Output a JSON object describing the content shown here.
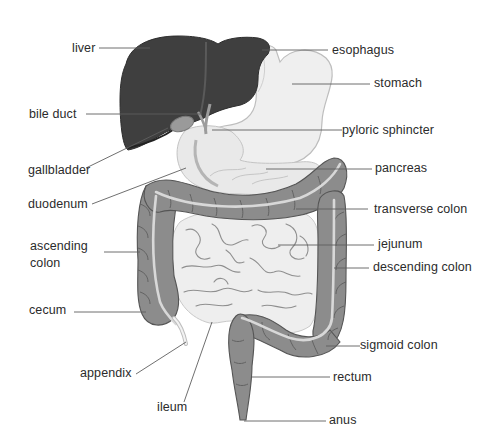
{
  "diagram": {
    "type": "anatomy-labeled-illustration",
    "colors": {
      "liver": "#3d3d3d",
      "stomach": "#ededed",
      "stomach_outline": "#b9b9b9",
      "colon": "#8a8a8a",
      "colon_outline": "#555555",
      "colon_stripe": "#d6d6d6",
      "small_intestine": "#ececec",
      "small_intestine_lines": "#8e8e8e",
      "leader_line": "#5a5a5a",
      "label_text": "#2b2b2b",
      "background": "#ffffff"
    },
    "labels_left": [
      {
        "id": "liver",
        "text": "liver"
      },
      {
        "id": "bile-duct",
        "text": "bile duct"
      },
      {
        "id": "gallbladder",
        "text": "gallbladder"
      },
      {
        "id": "duodenum",
        "text": "duodenum"
      },
      {
        "id": "ascending-colon",
        "text": "ascending colon"
      },
      {
        "id": "cecum",
        "text": "cecum"
      },
      {
        "id": "appendix",
        "text": "appendix"
      },
      {
        "id": "ileum",
        "text": "ileum"
      }
    ],
    "labels_right": [
      {
        "id": "esophagus",
        "text": "esophagus"
      },
      {
        "id": "stomach",
        "text": "stomach"
      },
      {
        "id": "pyloric-sphincter",
        "text": "pyloric sphincter"
      },
      {
        "id": "pancreas",
        "text": "pancreas"
      },
      {
        "id": "transverse-colon",
        "text": "transverse colon"
      },
      {
        "id": "jejunum",
        "text": "jejunum"
      },
      {
        "id": "descending-colon",
        "text": "descending colon"
      },
      {
        "id": "sigmoid-colon",
        "text": "sigmoid colon"
      },
      {
        "id": "rectum",
        "text": "rectum"
      },
      {
        "id": "anus",
        "text": "anus"
      }
    ]
  }
}
